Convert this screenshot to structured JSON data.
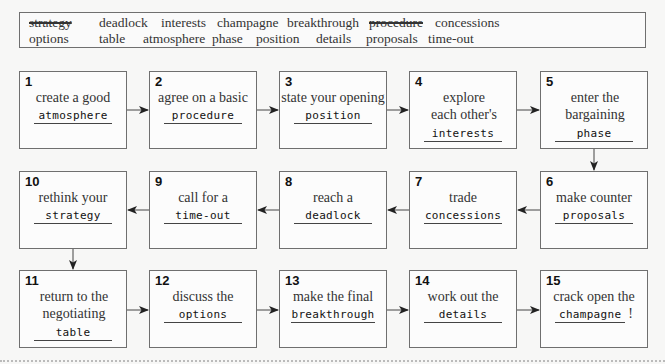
{
  "word_bank": {
    "row1": [
      {
        "text": "strategy",
        "struck": true
      },
      {
        "text": "deadlock",
        "struck": false
      },
      {
        "text": "interests",
        "struck": false
      },
      {
        "text": "champagne",
        "struck": false
      },
      {
        "text": "breakthrough",
        "struck": false
      },
      {
        "text": "procedure",
        "struck": true
      },
      {
        "text": "concessions",
        "struck": false
      }
    ],
    "row2": [
      {
        "text": "options",
        "struck": false
      },
      {
        "text": "table",
        "struck": false
      },
      {
        "text": "atmosphere",
        "struck": false
      },
      {
        "text": "phase",
        "struck": false
      },
      {
        "text": "position",
        "struck": false
      },
      {
        "text": "details",
        "struck": false
      },
      {
        "text": "proposals",
        "struck": false
      },
      {
        "text": "time-out",
        "struck": false
      }
    ]
  },
  "steps": [
    {
      "num": "1",
      "text": "create a good",
      "answer": "atmosphere"
    },
    {
      "num": "2",
      "text": "agree on a basic",
      "answer": "procedure"
    },
    {
      "num": "3",
      "text": "state your opening",
      "answer": "position"
    },
    {
      "num": "4",
      "text": "explore each other's",
      "answer": "interests"
    },
    {
      "num": "5",
      "text": "enter the bargaining",
      "answer": "phase"
    },
    {
      "num": "6",
      "text": "make counter",
      "answer": "proposals"
    },
    {
      "num": "7",
      "text": "trade",
      "answer": "concessions"
    },
    {
      "num": "8",
      "text": "reach a",
      "answer": "deadlock"
    },
    {
      "num": "9",
      "text": "call for a",
      "answer": "time-out"
    },
    {
      "num": "10",
      "text": "rethink your",
      "answer": "strategy"
    },
    {
      "num": "11",
      "text": "return to the negotiating",
      "answer": "table"
    },
    {
      "num": "12",
      "text": "discuss the",
      "answer": "options"
    },
    {
      "num": "13",
      "text": "make the final",
      "answer": "breakthrough"
    },
    {
      "num": "14",
      "text": "work out the",
      "answer": "details"
    },
    {
      "num": "15",
      "text": "crack open the",
      "answer": "champagne",
      "suffix": "!"
    }
  ],
  "colors": {
    "border": "#6f6f6f",
    "text": "#333333",
    "background": "#f7f7f6"
  }
}
